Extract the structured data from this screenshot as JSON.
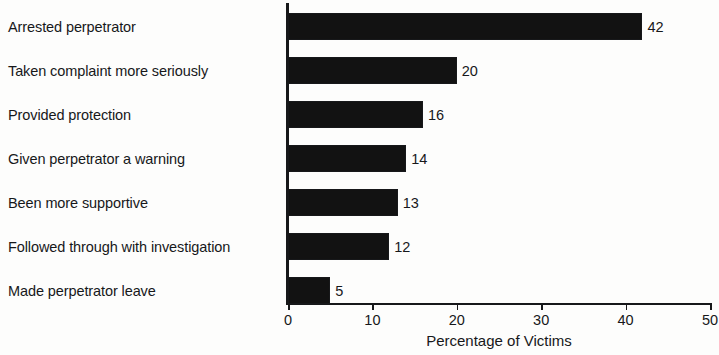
{
  "chart_data": {
    "type": "bar",
    "orientation": "horizontal",
    "title": "",
    "xlabel": "Percentage of Victims",
    "ylabel": "",
    "categories": [
      "Arrested perpetrator",
      "Taken complaint more seriously",
      "Provided protection",
      "Given perpetrator a warning",
      "Been more supportive",
      "Followed through with investigation",
      "Made perpetrator leave"
    ],
    "values": [
      42,
      20,
      16,
      14,
      13,
      12,
      5
    ],
    "value_labels": [
      "42",
      "20",
      "16",
      "14",
      "13",
      "12",
      "5"
    ],
    "xlim": [
      0,
      50
    ],
    "xticks": [
      0,
      10,
      20,
      30,
      40,
      50
    ],
    "xtick_labels": [
      "0",
      "10",
      "20",
      "30",
      "40",
      "50"
    ],
    "grid": false,
    "legend": false,
    "bar_color": "#121212",
    "axis_color": "#17181a",
    "background_color": "#fdfdfc"
  }
}
